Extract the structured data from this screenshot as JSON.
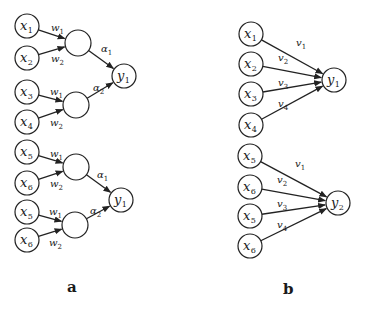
{
  "figure": {
    "panels": [
      {
        "id": "a",
        "label": "a",
        "label_pos": [
          67,
          292
        ],
        "blocks": [
          {
            "inputs": [
              {
                "name": "x",
                "sub": "1",
                "pos": [
                  27,
                  26
                ]
              },
              {
                "name": "x",
                "sub": "2",
                "pos": [
                  27,
                  58
                ]
              },
              {
                "name": "x",
                "sub": "3",
                "pos": [
                  27,
                  92
                ]
              },
              {
                "name": "x",
                "sub": "4",
                "pos": [
                  27,
                  122
                ]
              }
            ],
            "hidden": [
              {
                "pos": [
                  78,
                  43
                ],
                "inputs": [
                  0,
                  1
                ],
                "weights": [
                  {
                    "name": "w",
                    "sub": "1",
                    "pos": [
                      51,
                      31
                    ]
                  },
                  {
                    "name": "w",
                    "sub": "2",
                    "pos": [
                      51,
                      62
                    ]
                  }
                ]
              },
              {
                "pos": [
                  76,
                  105
                ],
                "inputs": [
                  2,
                  3
                ],
                "weights": [
                  {
                    "name": "w",
                    "sub": "1",
                    "pos": [
                      50,
                      95
                    ]
                  },
                  {
                    "name": "w",
                    "sub": "2",
                    "pos": [
                      50,
                      126
                    ]
                  }
                ]
              }
            ],
            "output": {
              "name": "y",
              "sub": "1",
              "pos": [
                124,
                76
              ]
            },
            "output_weights": [
              {
                "name": "α",
                "sub": "1",
                "pos": [
                  101,
                  52
                ]
              },
              {
                "name": "α",
                "sub": "2",
                "pos": [
                  93,
                  91
                ]
              }
            ]
          },
          {
            "inputs": [
              {
                "name": "x",
                "sub": "5",
                "pos": [
                  27,
                  152
                ]
              },
              {
                "name": "x",
                "sub": "6",
                "pos": [
                  27,
                  183
                ]
              },
              {
                "name": "x",
                "sub": "5",
                "pos": [
                  27,
                  212
                ]
              },
              {
                "name": "x",
                "sub": "6",
                "pos": [
                  27,
                  240
                ]
              }
            ],
            "hidden": [
              {
                "pos": [
                  76,
                  167
                ],
                "inputs": [
                  0,
                  1
                ],
                "weights": [
                  {
                    "name": "w",
                    "sub": "1",
                    "pos": [
                      50,
                      157
                    ]
                  },
                  {
                    "name": "w",
                    "sub": "2",
                    "pos": [
                      50,
                      187
                    ]
                  }
                ]
              },
              {
                "pos": [
                  75,
                  225
                ],
                "inputs": [
                  2,
                  3
                ],
                "weights": [
                  {
                    "name": "w",
                    "sub": "1",
                    "pos": [
                      49,
                      215
                    ]
                  },
                  {
                    "name": "w",
                    "sub": "2",
                    "pos": [
                      49,
                      246
                    ]
                  }
                ]
              }
            ],
            "output": {
              "name": "y",
              "sub": "1",
              "pos": [
                121,
                200
              ]
            },
            "output_weights": [
              {
                "name": "α",
                "sub": "1",
                "pos": [
                  97,
                  178
                ]
              },
              {
                "name": "α",
                "sub": "2",
                "pos": [
                  90,
                  214
                ]
              }
            ]
          }
        ]
      },
      {
        "id": "b",
        "label": "b",
        "label_pos": [
          283,
          294
        ],
        "blocks": [
          {
            "inputs": [
              {
                "name": "x",
                "sub": "1",
                "pos": [
                  251,
                  34
                ]
              },
              {
                "name": "x",
                "sub": "2",
                "pos": [
                  251,
                  64
                ]
              },
              {
                "name": "x",
                "sub": "3",
                "pos": [
                  251,
                  94
                ]
              },
              {
                "name": "x",
                "sub": "4",
                "pos": [
                  251,
                  125
                ]
              }
            ],
            "output": {
              "name": "y",
              "sub": "1",
              "pos": [
                334,
                80
              ]
            },
            "weights": [
              {
                "name": "v",
                "sub": "1",
                "pos": [
                  296,
                  46
                ]
              },
              {
                "name": "v",
                "sub": "2",
                "pos": [
                  278,
                  61
                ]
              },
              {
                "name": "v",
                "sub": "3",
                "pos": [
                  278,
                  86
                ]
              },
              {
                "name": "v",
                "sub": "4",
                "pos": [
                  278,
                  107
                ]
              }
            ]
          },
          {
            "inputs": [
              {
                "name": "x",
                "sub": "5",
                "pos": [
                  250,
                  156
                ]
              },
              {
                "name": "x",
                "sub": "6",
                "pos": [
                  250,
                  187
                ]
              },
              {
                "name": "x",
                "sub": "5",
                "pos": [
                  250,
                  216
                ]
              },
              {
                "name": "x",
                "sub": "6",
                "pos": [
                  250,
                  246
                ]
              }
            ],
            "output": {
              "name": "y",
              "sub": "2",
              "pos": [
                338,
                203
              ]
            },
            "weights": [
              {
                "name": "v",
                "sub": "1",
                "pos": [
                  295,
                  167
                ]
              },
              {
                "name": "v",
                "sub": "2",
                "pos": [
                  277,
                  183
                ]
              },
              {
                "name": "v",
                "sub": "3",
                "pos": [
                  277,
                  207
                ]
              },
              {
                "name": "v",
                "sub": "4",
                "pos": [
                  277,
                  228
                ]
              }
            ]
          }
        ]
      }
    ],
    "style": {
      "node_radius": 12,
      "hidden_radius": 13,
      "stroke_color": "#222222",
      "background": "#ffffff"
    }
  }
}
